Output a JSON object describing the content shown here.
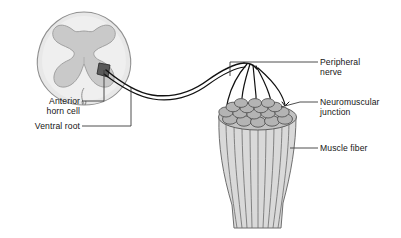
{
  "figure": {
    "type": "anatomical-diagram",
    "background": "#ffffff"
  },
  "labels": {
    "anterior_horn_cell": {
      "line1": "Anterior",
      "line2": "horn cell"
    },
    "ventral_root": "Ventral root",
    "peripheral_nerve": {
      "line1": "Peripheral",
      "line2": "nerve"
    },
    "neuromuscular_junction": {
      "line1": "Neuromuscular",
      "line2": "junction"
    },
    "muscle_fiber": "Muscle fiber"
  },
  "colors": {
    "outline": "#4a4a4a",
    "white_matter": "#e6e6e6",
    "gray_matter": "#c9c9c9",
    "cord_edge": "#8c8c8c",
    "horn_cell_marker": "#555555",
    "nerve": "#111111",
    "muscle_top": "#b0b0b0",
    "muscle_body": "#d5d5d5",
    "muscle_line": "#6b6b6b",
    "leader": "#3b3b3b",
    "text": "#151515"
  },
  "structures": {
    "spinal_cord": "cross-section with butterfly-shaped gray matter",
    "nerve_branch_count": 5,
    "muscle_fiber_count": 9
  }
}
